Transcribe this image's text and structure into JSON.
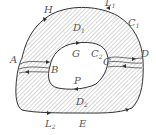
{
  "diagram": {
    "type": "multiply-connected region with cut lines (Green's theorem)",
    "colors": {
      "stroke": "#333333",
      "hatch": "#8a8a8a",
      "label": "#555555",
      "background": "#ffffff"
    },
    "labels": {
      "H": "H",
      "L1": "L",
      "L1_sub": "1",
      "C1": "C",
      "C1_sub": "1",
      "D": "D",
      "A": "A",
      "B": "B",
      "G": "G",
      "C2": "C",
      "C2_sub": "2",
      "C": "C",
      "P": "P",
      "D1": "D",
      "D1_sub": "1",
      "D2": "D",
      "D2_sub": "2",
      "L2": "L",
      "L2_sub": "2",
      "E": "E"
    },
    "curves": [
      {
        "name": "outer-boundary",
        "label": "C1",
        "orientation": "counterclockwise"
      },
      {
        "name": "inner-boundary",
        "label": "C2",
        "orientation": "clockwise"
      },
      {
        "name": "cut-AB",
        "description": "two parallel arrows between A and B"
      },
      {
        "name": "cut-CD",
        "description": "two parallel arrows between C and D"
      }
    ],
    "regions": [
      {
        "name": "upper-region",
        "label": "D1"
      },
      {
        "name": "lower-region",
        "label": "D2"
      }
    ]
  }
}
